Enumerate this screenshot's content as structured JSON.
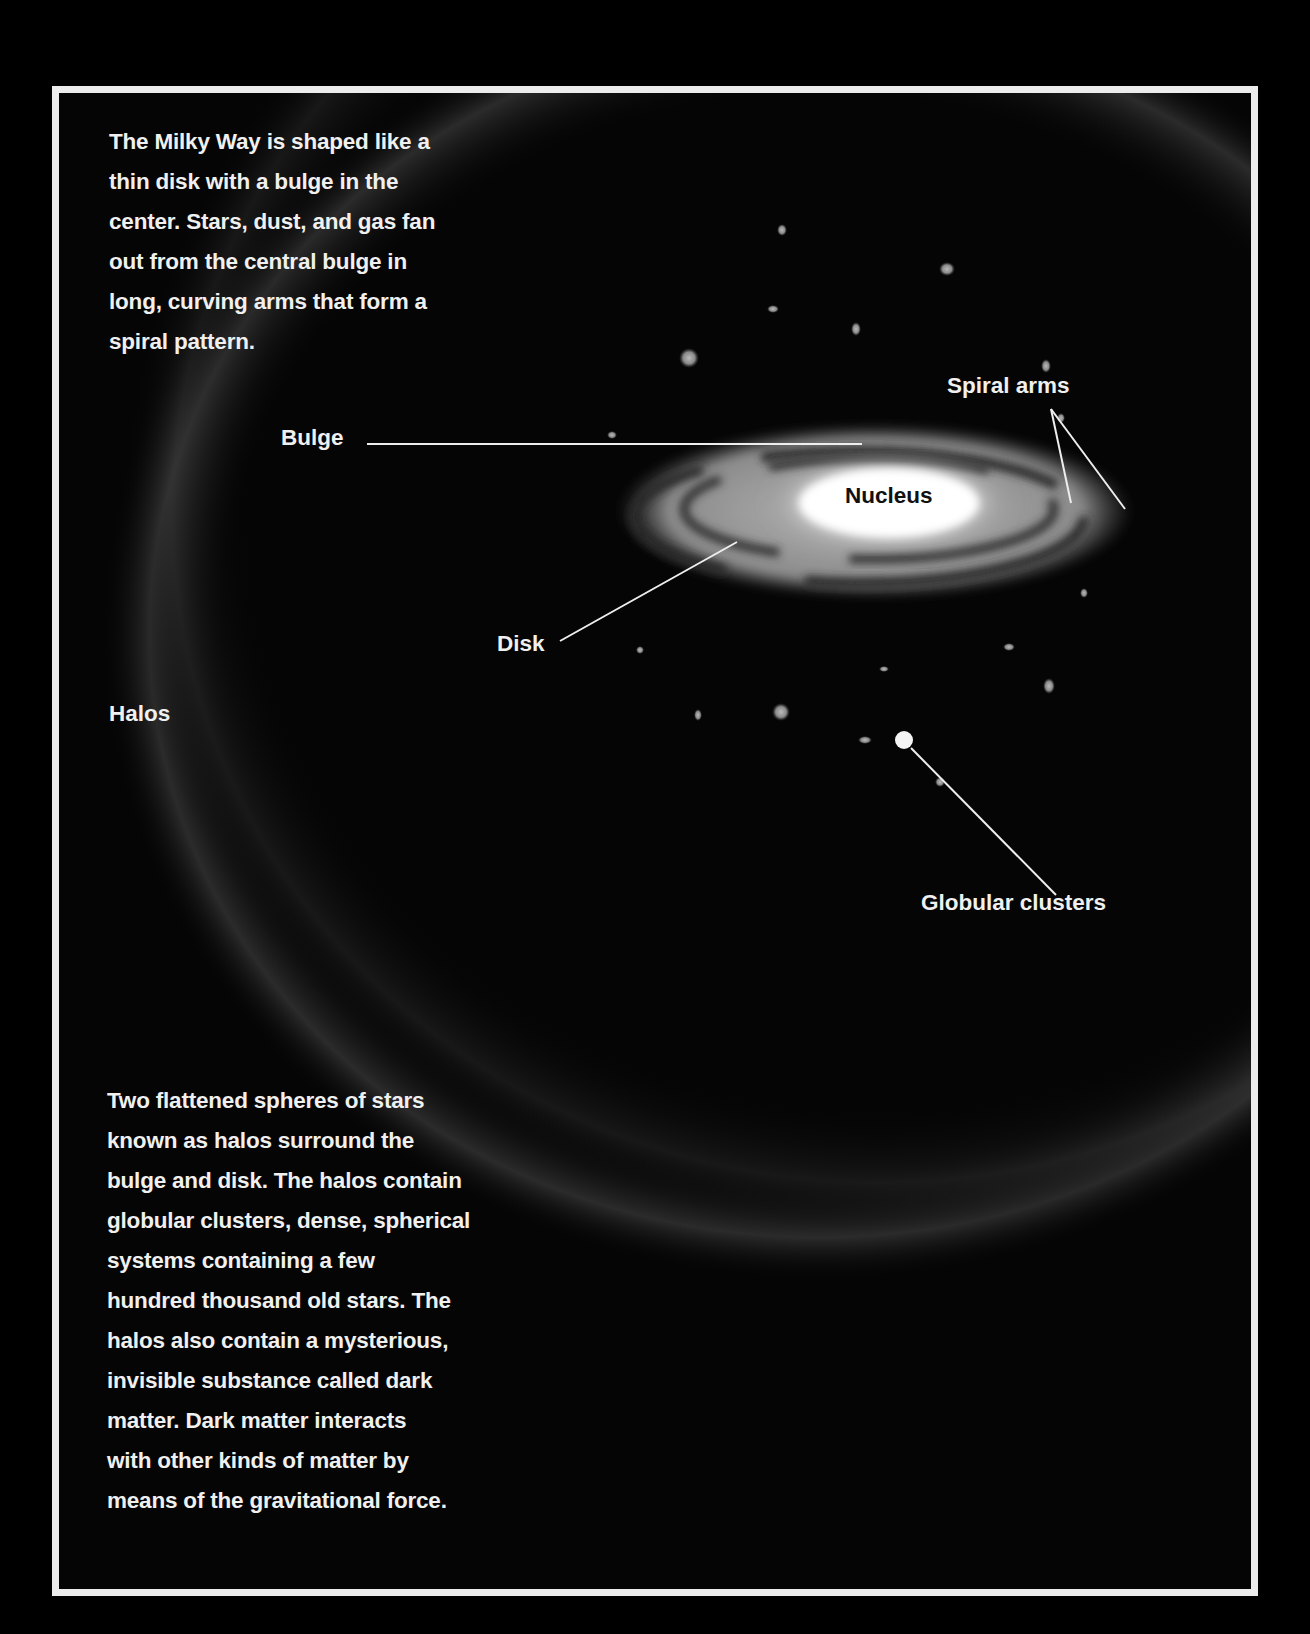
{
  "intro": {
    "lines": [
      "The Milky Way is shaped like a",
      "thin disk with a bulge in the",
      "center. Stars, dust, and gas fan",
      "out from the central bulge in",
      "long, curving arms that form a",
      "spiral pattern."
    ]
  },
  "labels": {
    "bulge": "Bulge",
    "nucleus": "Nucleus",
    "spiral_arms": "Spiral arms",
    "disk": "Disk",
    "halos": "Halos",
    "globular_clusters": "Globular clusters"
  },
  "halo_text": {
    "lines": [
      "Two flattened spheres of stars",
      "known as halos surround the",
      "bulge and disk. The halos contain",
      "globular clusters, dense, spherical",
      "systems containing a few",
      "hundred thousand old stars. The",
      "halos also contain a mysterious,",
      "invisible substance called dark",
      "matter.  Dark matter interacts",
      "with other kinds of matter by",
      "means of the gravitational force."
    ]
  },
  "colors": {
    "background": "#000000",
    "frame_border": "#ececec",
    "text": "#f0f0f0",
    "nucleus_text": "#111111"
  }
}
